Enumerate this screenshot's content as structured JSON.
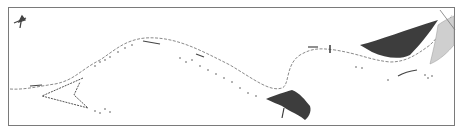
{
  "map": {
    "frame": {
      "x": 8,
      "y": 7,
      "width": 447,
      "height": 119,
      "stroke": "#7a7a7a"
    },
    "colors": {
      "line": "#8a8a8a",
      "dark_fill": "#3d3d3d",
      "light_fill": "#cfcfcf",
      "dots": "#555555"
    },
    "north_arrow": {
      "label": ""
    },
    "features": [
      {
        "name": "shoreline",
        "type": "line"
      },
      {
        "name": "left-lagoon-spit",
        "type": "line"
      },
      {
        "name": "east-dark-deposit",
        "type": "filled-area"
      },
      {
        "name": "south-dark-deposit",
        "type": "filled-area"
      },
      {
        "name": "east-light-bank",
        "type": "filled-area"
      }
    ]
  }
}
